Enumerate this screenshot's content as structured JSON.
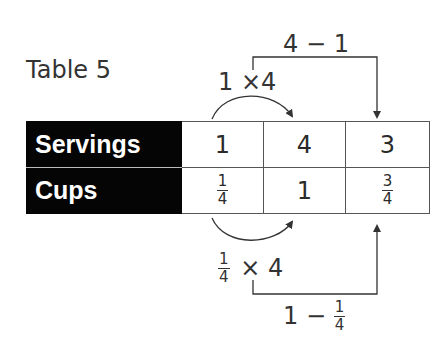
{
  "title": "Table 5",
  "table": {
    "rows": [
      {
        "header": "Servings",
        "cells": [
          {
            "value": "1"
          },
          {
            "value": "4"
          },
          {
            "value": "3"
          }
        ]
      },
      {
        "header": "Cups",
        "cells": [
          {
            "num": "1",
            "den": "4"
          },
          {
            "value": "1"
          },
          {
            "num": "3",
            "den": "4"
          }
        ]
      }
    ]
  },
  "annotations": {
    "top_curve": {
      "left": "1",
      "op": "×",
      "right": "4"
    },
    "top_bracket": {
      "left": "4",
      "op": "−",
      "right": "1"
    },
    "bottom_curve": {
      "num": "1",
      "den": "4",
      "op": "×",
      "right": "4"
    },
    "bottom_bracket": {
      "left": "1",
      "op": "−",
      "num": "1",
      "den": "4"
    }
  },
  "colors": {
    "header_bg": "#050505",
    "header_text": "#ffffff",
    "border": "#555555",
    "arrow": "#333333"
  }
}
